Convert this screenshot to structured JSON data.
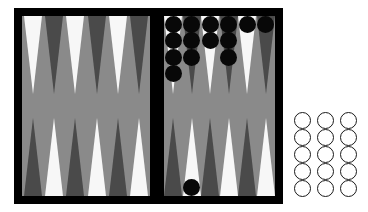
{
  "app": {
    "title": "Backgammon Board",
    "kind": "board-game-illustration"
  },
  "colors": {
    "frame": "#000000",
    "felt": "#8a8a8a",
    "point_light": "#f7f7f7",
    "point_dark": "#4a4a4a",
    "checker_black": "#080808",
    "checker_white_fill": "#ffffff",
    "checker_white_stroke": "#1a1a1a",
    "page_background": "#ffffff"
  },
  "board": {
    "frame": {
      "x": 14,
      "y": 8,
      "width": 269,
      "height": 196,
      "border": 8
    },
    "center_bar": {
      "x": 136,
      "y": 0,
      "width": 14,
      "height": 196
    },
    "quadrants": [
      {
        "name": "top-left",
        "x": 8,
        "y": 8,
        "width": 128,
        "height": 180,
        "point_count": 6
      },
      {
        "name": "top-right",
        "x": 150,
        "y": 8,
        "width": 111,
        "height": 180,
        "point_count": 6
      },
      {
        "name": "bottom-left",
        "x": 8,
        "y": 8,
        "width": 128,
        "height": 180,
        "point_count": 6
      },
      {
        "name": "bottom-right",
        "x": 150,
        "y": 8,
        "width": 111,
        "height": 180,
        "point_count": 6
      }
    ],
    "point_colors": {
      "top_left": [
        "light",
        "dark",
        "light",
        "dark",
        "light",
        "dark"
      ],
      "top_right": [
        "light",
        "dark",
        "light",
        "dark",
        "light",
        "dark"
      ],
      "bottom_left": [
        "dark",
        "light",
        "dark",
        "light",
        "dark",
        "light"
      ],
      "bottom_right": [
        "dark",
        "light",
        "dark",
        "light",
        "dark",
        "light"
      ]
    },
    "point_geometry": {
      "half_width": 9,
      "height": 78,
      "left_spacing": 21.3,
      "left_first_center": 10.6,
      "right_spacing": 18.5,
      "right_first_center": 9.2
    }
  },
  "checkers": {
    "black_label": "black-checker",
    "white_label": "white-checker",
    "diameter": 17,
    "top_right_stacks": [
      {
        "point_index": 1,
        "count": 4
      },
      {
        "point_index": 2,
        "count": 3
      },
      {
        "point_index": 3,
        "count": 2
      },
      {
        "point_index": 4,
        "count": 3
      },
      {
        "point_index": 5,
        "count": 1
      },
      {
        "point_index": 6,
        "count": 1
      }
    ],
    "bottom_right_stacks": [
      {
        "point_index": 2,
        "count": 1
      }
    ],
    "total_black_on_board": 15
  },
  "white_tray": {
    "label": "white-checker-tray",
    "x": 294,
    "y": 112,
    "columns": 3,
    "rows": 5,
    "count": 15,
    "cell_spacing_x": 23,
    "cell_spacing_y": 17,
    "checker_diameter": 17
  }
}
